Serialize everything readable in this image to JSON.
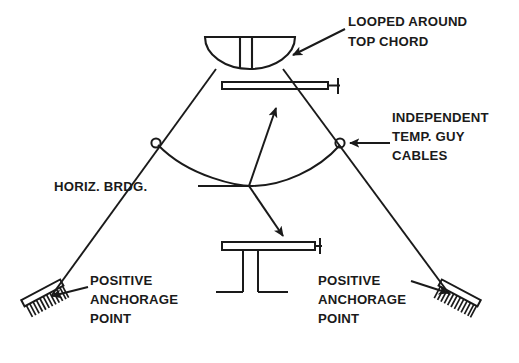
{
  "figure": {
    "background_color": "#ffffff",
    "line_color": "#1a1a1a",
    "text_color": "#1a1a1a"
  },
  "labels": {
    "looped_around": {
      "name": "looped-around-top-chord",
      "line1": "LOOPED AROUND",
      "line2": "TOP CHORD"
    },
    "independent_guy": {
      "name": "independent-temp-guy-cables",
      "line1": "INDEPENDENT",
      "line2": "TEMP. GUY",
      "line3": "CABLES"
    },
    "horiz_brdg": {
      "name": "horizontal-bridging",
      "line1": "HORIZ.  BRDG."
    },
    "anchorage_left": {
      "name": "positive-anchorage-point-left",
      "line1": "POSITIVE",
      "line2": "ANCHORAGE",
      "line3": "POINT"
    },
    "anchorage_right": {
      "name": "positive-anchorage-point-right",
      "line1": "POSITIVE",
      "line2": "ANCHORAGE",
      "line3": "POINT"
    }
  },
  "components": {
    "loop_symbol": "cable-loop-bowl",
    "top_chord_beam": "top-chord-beam-section",
    "bridging_beam_detail": "bridging-beam-section-detail",
    "guy_cable_left": "guy-cable-left",
    "guy_cable_right": "guy-cable-right",
    "bridging_arc": "horizontal-bridging-arc",
    "junction_left": "cable-junction-node-left",
    "junction_right": "cable-junction-node-right",
    "anchor_left": "anchorage-hatch-left",
    "anchor_right": "anchorage-hatch-right"
  }
}
